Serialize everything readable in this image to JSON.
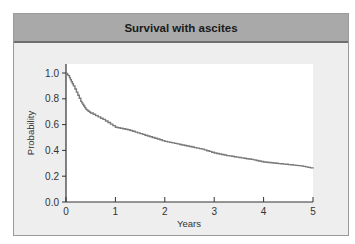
{
  "title": "Survival with ascites",
  "chart_data": {
    "type": "line",
    "title": "Survival with ascites",
    "xlabel": "Years",
    "ylabel": "Probability",
    "xlim": [
      0,
      5
    ],
    "ylim": [
      0,
      1.0
    ],
    "x_ticks": [
      "0",
      "1",
      "2",
      "3",
      "4",
      "5"
    ],
    "y_ticks": [
      "0.0",
      "0.2",
      "0.4",
      "0.6",
      "0.8",
      "1.0"
    ],
    "grid": false,
    "legend": null,
    "series": [
      {
        "name": "Survival with ascites",
        "color": "#7a7a7a",
        "x": [
          0,
          0.05,
          0.15,
          0.3,
          0.4,
          0.5,
          0.75,
          1.0,
          1.25,
          1.5,
          1.75,
          2.0,
          2.25,
          2.5,
          2.75,
          3.0,
          3.25,
          3.5,
          3.75,
          4.0,
          4.25,
          4.5,
          4.75,
          5.0
        ],
        "y": [
          1.0,
          0.98,
          0.9,
          0.78,
          0.72,
          0.69,
          0.64,
          0.58,
          0.56,
          0.53,
          0.5,
          0.47,
          0.45,
          0.43,
          0.41,
          0.38,
          0.36,
          0.345,
          0.33,
          0.31,
          0.3,
          0.29,
          0.28,
          0.26
        ]
      }
    ]
  },
  "colors": {
    "header_bg": "#a9a9a9",
    "panel_bg": "#eeeeee",
    "plot_bg": "#ffffff",
    "line": "#7a7a7a",
    "axis": "#333333"
  }
}
